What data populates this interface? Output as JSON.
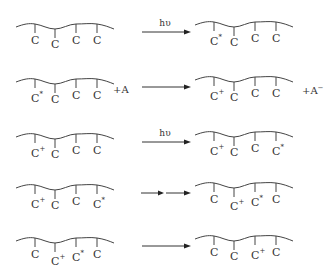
{
  "diagram": {
    "rows": [
      {
        "left": {
          "atoms": [
            "C",
            "C",
            "C",
            "C"
          ],
          "charges": [
            "",
            "",
            "",
            ""
          ]
        },
        "arrow": {
          "label": "hυ",
          "style": "single"
        },
        "right": {
          "atoms": [
            "C",
            "C",
            "C",
            "C"
          ],
          "charges": [
            "*",
            "",
            "",
            ""
          ]
        },
        "left_extra": "",
        "right_extra": ""
      },
      {
        "left": {
          "atoms": [
            "C",
            "C",
            "C",
            "C"
          ],
          "charges": [
            "*",
            "",
            "",
            ""
          ]
        },
        "arrow": {
          "label": "",
          "style": "single"
        },
        "right": {
          "atoms": [
            "C",
            "C",
            "C",
            "C"
          ],
          "charges": [
            "+",
            "",
            "",
            ""
          ]
        },
        "left_extra": "+A",
        "right_extra": "+A",
        "right_extra_sup": "−"
      },
      {
        "left": {
          "atoms": [
            "C",
            "C",
            "C",
            "C"
          ],
          "charges": [
            "+",
            "",
            "",
            ""
          ]
        },
        "arrow": {
          "label": "hυ",
          "style": "single"
        },
        "right": {
          "atoms": [
            "C",
            "C",
            "C",
            "C"
          ],
          "charges": [
            "+",
            "",
            "",
            "*"
          ]
        },
        "left_extra": "",
        "right_extra": ""
      },
      {
        "left": {
          "atoms": [
            "C",
            "C",
            "C",
            "C"
          ],
          "charges": [
            "+",
            "",
            "",
            "*"
          ]
        },
        "arrow": {
          "label": "",
          "style": "double"
        },
        "right": {
          "atoms": [
            "C",
            "C",
            "C",
            "C"
          ],
          "charges": [
            "",
            "+",
            "*",
            ""
          ]
        },
        "left_extra": "",
        "right_extra": ""
      },
      {
        "left": {
          "atoms": [
            "C",
            "C",
            "C",
            "C"
          ],
          "charges": [
            "",
            "+",
            "*",
            ""
          ]
        },
        "arrow": {
          "label": "",
          "style": "single"
        },
        "right": {
          "atoms": [
            "C",
            "C",
            "C",
            "C"
          ],
          "charges": [
            "",
            "",
            "+",
            ""
          ]
        },
        "left_extra": "",
        "right_extra": ""
      }
    ]
  }
}
